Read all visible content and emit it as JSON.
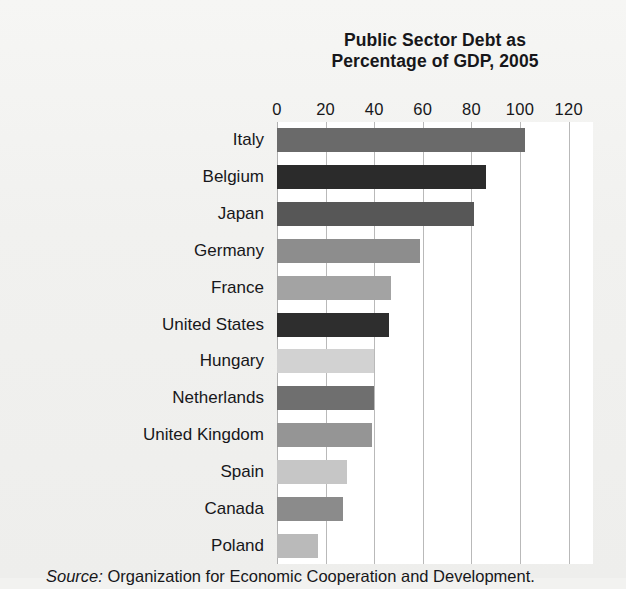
{
  "chart_data": {
    "type": "bar",
    "orientation": "horizontal",
    "title": "Public Sector Debt as Percentage of GDP, 2005",
    "title_lines": [
      "Public Sector Debt as",
      "Percentage of GDP, 2005"
    ],
    "xlabel": "",
    "ylabel": "",
    "xlim": [
      0,
      130
    ],
    "xticks": [
      0,
      20,
      40,
      60,
      80,
      100,
      120
    ],
    "xtick_labels": [
      "0",
      "20",
      "40",
      "60",
      "80",
      "100",
      "120"
    ],
    "grid": "vertical",
    "legend": "none",
    "categories": [
      "Italy",
      "Belgium",
      "Japan",
      "Germany",
      "France",
      "United States",
      "Hungary",
      "Netherlands",
      "United Kingdom",
      "Spain",
      "Canada",
      "Poland"
    ],
    "values": [
      102,
      86,
      81,
      59,
      47,
      46,
      40,
      40,
      39,
      29,
      27,
      17
    ],
    "bar_colors": [
      "#6a6a6a",
      "#2b2b2b",
      "#575757",
      "#8d8d8d",
      "#a3a3a3",
      "#2e2e2e",
      "#d2d2d2",
      "#6f6f6f",
      "#959595",
      "#c6c6c6",
      "#8b8b8b",
      "#bababa"
    ],
    "bars": [
      {
        "label": "Italy",
        "value": 102,
        "color": "#6a6a6a"
      },
      {
        "label": "Belgium",
        "value": 86,
        "color": "#2b2b2b"
      },
      {
        "label": "Japan",
        "value": 81,
        "color": "#575757"
      },
      {
        "label": "Germany",
        "value": 59,
        "color": "#8d8d8d"
      },
      {
        "label": "France",
        "value": 47,
        "color": "#a3a3a3"
      },
      {
        "label": "United States",
        "value": 46,
        "color": "#2e2e2e"
      },
      {
        "label": "Hungary",
        "value": 40,
        "color": "#d2d2d2"
      },
      {
        "label": "Netherlands",
        "value": 40,
        "color": "#6f6f6f"
      },
      {
        "label": "United Kingdom",
        "value": 39,
        "color": "#959595"
      },
      {
        "label": "Spain",
        "value": 29,
        "color": "#c6c6c6"
      },
      {
        "label": "Canada",
        "value": 27,
        "color": "#8b8b8b"
      },
      {
        "label": "Poland",
        "value": 17,
        "color": "#bababa"
      }
    ]
  },
  "source": {
    "label": "Source:",
    "text": "Organization for Economic Cooperation and Development."
  },
  "colors": {
    "page_background": "#f1f1ef",
    "plot_background": "#ffffff",
    "gridline": "#b9b9b9",
    "text": "#17171a"
  }
}
